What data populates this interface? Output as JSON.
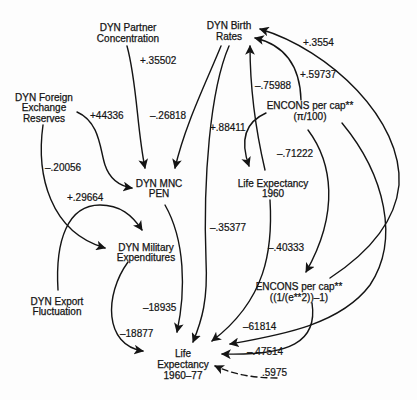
{
  "diagram": {
    "nodes": {
      "partner_concentration": {
        "line1": "DYN Partner",
        "line2": "Concentration"
      },
      "birth_rates": {
        "line1": "DYN Birth",
        "line2": "Rates"
      },
      "foreign_exchange": {
        "line1": "DYN Foreign",
        "line2": "Exchange",
        "line3": "Reserves"
      },
      "mnc_pen": {
        "line1": "DYN MNC",
        "line2": "PEN"
      },
      "military_expenditures": {
        "line1": "DYN Military",
        "line2": "Expenditures"
      },
      "export_fluctuation": {
        "line1": "DYN Export",
        "line2": "Fluctuation"
      },
      "life_expectancy_1960": {
        "line1": "Life Expectancy",
        "line2": "1960"
      },
      "encons_pi": {
        "line1": "ENCONS per cap**",
        "line2": "(π/100)"
      },
      "encons_exp": {
        "line1": "ENCONS per cap**",
        "line2": "((1/(e**2))–1)"
      },
      "life_expectancy_1960_77": {
        "line1": "Life",
        "line2": "Expectancy",
        "line3": "1960–77"
      }
    },
    "edges": [
      {
        "from": "partner_concentration",
        "to": "mnc_pen",
        "label": "+.35502",
        "style": "solid"
      },
      {
        "from": "foreign_exchange",
        "to": "mnc_pen",
        "label": "+44336",
        "style": "solid"
      },
      {
        "from": "birth_rates",
        "to": "mnc_pen",
        "label": "–.26818",
        "style": "solid"
      },
      {
        "from": "foreign_exchange",
        "to": "military_expenditures",
        "label": "–.20056",
        "style": "solid"
      },
      {
        "from": "export_fluctuation",
        "to": "military_expenditures",
        "label": "+.29664",
        "style": "solid"
      },
      {
        "from": "encons_exp",
        "to": "birth_rates",
        "label": "+.3554",
        "style": "solid"
      },
      {
        "from": "encons_pi",
        "to": "birth_rates",
        "label": "+.59737",
        "style": "solid"
      },
      {
        "from": "life_expectancy_1960",
        "to": "birth_rates",
        "label": "–.75988",
        "style": "solid"
      },
      {
        "from": "encons_pi",
        "to": "life_expectancy_1960",
        "label": "+.88411",
        "style": "solid"
      },
      {
        "from": "encons_pi",
        "to": "encons_exp",
        "label": "–.71222",
        "style": "solid"
      },
      {
        "from": "birth_rates",
        "to": "life_expectancy_1960_77",
        "label": "–.35377",
        "style": "solid"
      },
      {
        "from": "life_expectancy_1960",
        "to": "life_expectancy_1960_77",
        "label": "–.40333",
        "style": "solid"
      },
      {
        "from": "mnc_pen",
        "to": "life_expectancy_1960_77",
        "label": "–18935",
        "style": "solid"
      },
      {
        "from": "military_expenditures",
        "to": "life_expectancy_1960_77",
        "label": "–18877",
        "style": "solid"
      },
      {
        "from": "encons_pi",
        "to": "life_expectancy_1960_77",
        "label": "–61814",
        "style": "solid"
      },
      {
        "from": "encons_exp",
        "to": "life_expectancy_1960_77",
        "label": "–.47514",
        "style": "solid"
      },
      {
        "from": "residual",
        "to": "life_expectancy_1960_77",
        "label": ".5975",
        "style": "dashed"
      }
    ],
    "colors": {
      "ink": "#141414",
      "background": "#fdfdfd"
    }
  }
}
